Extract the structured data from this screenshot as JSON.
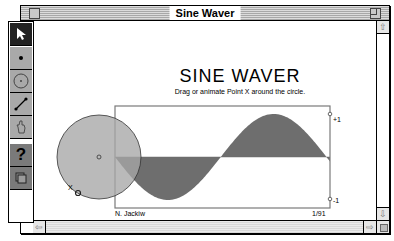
{
  "window": {
    "title": "Sine Waver"
  },
  "toolbox": {
    "tools": [
      {
        "name": "selection-arrow-tool",
        "icon": "arrow-icon",
        "selected": true
      },
      {
        "name": "point-tool",
        "icon": "point-icon",
        "selected": false
      },
      {
        "name": "compass-tool",
        "icon": "circle-icon",
        "selected": false
      },
      {
        "name": "straightedge-tool",
        "icon": "segment-icon",
        "selected": false
      },
      {
        "name": "text-tool",
        "icon": "hand-icon",
        "selected": false
      },
      {
        "name": "help-tool",
        "icon": "question-icon",
        "label": "?",
        "selected": false
      },
      {
        "name": "custom-tool",
        "icon": "stack-icon",
        "selected": false
      }
    ]
  },
  "sketch": {
    "heading": "SINE WAVER",
    "subtitle": "Drag or animate Point X around the circle.",
    "author": "N. Jackiw",
    "date": "1/91",
    "axis_top_label": "+1",
    "axis_bottom_label": "-1",
    "point_label": "X",
    "colors": {
      "circle_fill": "#a6a6a6",
      "wave_fill": "#6e6e6e",
      "frame": "#7a7a7a"
    },
    "wave": {
      "amplitude": 1,
      "x_start_phase_deg": 180,
      "x_end_phase_deg": 546,
      "description": "Filled sine curve between +1 and -1 markers"
    }
  },
  "scrollbars": {
    "up_arrow": "⇧",
    "down_arrow": "⇩",
    "left_arrow": "⇦",
    "right_arrow": "⇨"
  }
}
